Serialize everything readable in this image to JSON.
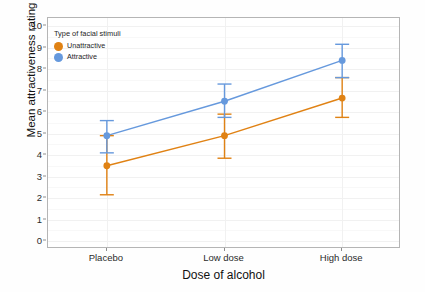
{
  "chart_data": {
    "type": "line",
    "title": "",
    "xlabel": "Dose of alcohol",
    "ylabel": "Mean attractiveness rating",
    "categories": [
      "Placebo",
      "Low dose",
      "High dose"
    ],
    "ylim": [
      0,
      10
    ],
    "yticks": [
      0,
      1,
      2,
      3,
      4,
      5,
      6,
      7,
      8,
      9,
      10
    ],
    "ytick_labels": [
      "0",
      "1",
      "2",
      "3",
      "4",
      "5",
      "6",
      "7",
      "8",
      "9",
      "10"
    ],
    "grid": true,
    "legend_position": "top-left inside panel",
    "legend_title": "Type of facial stimuli",
    "error_bars": "confidence interval caps",
    "series": [
      {
        "name": "Unattractive",
        "color": "#E08214",
        "values": [
          3.5,
          4.9,
          6.65
        ],
        "ci_lower": [
          2.15,
          3.85,
          5.75
        ],
        "ci_upper": [
          4.9,
          5.9,
          7.6
        ]
      },
      {
        "name": "Attractive",
        "color": "#6699DD",
        "values": [
          4.9,
          6.5,
          8.4
        ],
        "ci_lower": [
          4.1,
          5.75,
          7.6
        ],
        "ci_upper": [
          5.6,
          7.3,
          9.15
        ]
      }
    ]
  },
  "colors": {
    "unattractive": "#E08214",
    "attractive": "#6699DD",
    "panel_border": "#b5b5b5",
    "gridline": "#f1f1f1",
    "background": "#fefefe"
  },
  "axes": {
    "y_title": "Mean attractiveness rating",
    "x_title": "Dose of alcohol"
  },
  "legend": {
    "title": "Type of facial stimuli",
    "items": [
      {
        "label": "Unattractive",
        "color": "#E08214"
      },
      {
        "label": "Attractive",
        "color": "#6699DD"
      }
    ]
  }
}
